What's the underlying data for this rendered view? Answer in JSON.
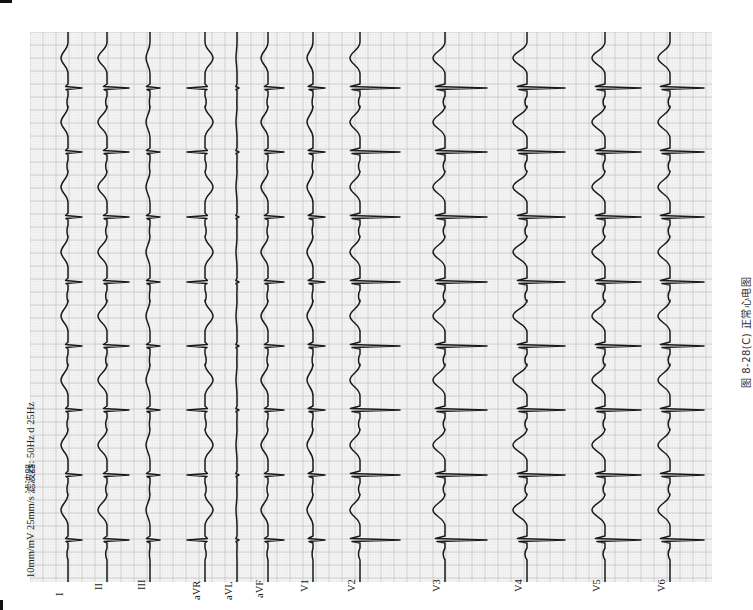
{
  "figure": {
    "caption": "图 8-28(C)  正常心电图",
    "settings_line": "10mm/mV  25mm/s  滤波器: 50Hz  d  25Hz"
  },
  "ecg": {
    "orientation": "rotated 90° counter-clockwise; time runs bottom to top",
    "paper_color": "#f3f3f3",
    "grid_major_color": "#c4c4c4",
    "grid_minor_color": "#d6d6d6",
    "trace_color": "#1a1a1a",
    "beat_positions_y": [
      88,
      152,
      217,
      282,
      346,
      410,
      475,
      540
    ],
    "leads": [
      {
        "name": "I",
        "label": "I",
        "baseline_x": 68,
        "r": 14,
        "s": 2,
        "t": -7,
        "label_y": 596
      },
      {
        "name": "II",
        "label": "II",
        "baseline_x": 107,
        "r": 22,
        "s": 3,
        "t": -9,
        "label_y": 590
      },
      {
        "name": "III",
        "label": "III",
        "baseline_x": 150,
        "r": 10,
        "s": 3,
        "t": -4,
        "label_y": 590
      },
      {
        "name": "aVR",
        "label": "aVR",
        "baseline_x": 205,
        "r": -18,
        "s": -2,
        "t": 8,
        "label_y": 600
      },
      {
        "name": "aVL",
        "label": "aVL",
        "baseline_x": 237,
        "r": 2,
        "s": 1,
        "t": -1,
        "label_y": 600
      },
      {
        "name": "aVF",
        "label": "aVF",
        "baseline_x": 268,
        "r": 16,
        "s": 3,
        "t": -7,
        "label_y": 598
      },
      {
        "name": "V1",
        "label": "V1",
        "baseline_x": 313,
        "r": 12,
        "s": 4,
        "t": -6,
        "label_y": 592
      },
      {
        "name": "V2",
        "label": "V2",
        "baseline_x": 360,
        "r": 40,
        "s": 8,
        "t": -10,
        "label_y": 592
      },
      {
        "name": "V3",
        "label": "V3",
        "baseline_x": 445,
        "r": 42,
        "s": 8,
        "t": -12,
        "label_y": 592
      },
      {
        "name": "V4",
        "label": "V4",
        "baseline_x": 527,
        "r": 38,
        "s": 8,
        "t": -14,
        "label_y": 592
      },
      {
        "name": "V5",
        "label": "V5",
        "baseline_x": 605,
        "r": 36,
        "s": 8,
        "t": -13,
        "label_y": 592
      },
      {
        "name": "V6",
        "label": "V6",
        "baseline_x": 670,
        "r": 34,
        "s": 8,
        "t": -12,
        "label_y": 592
      }
    ]
  }
}
